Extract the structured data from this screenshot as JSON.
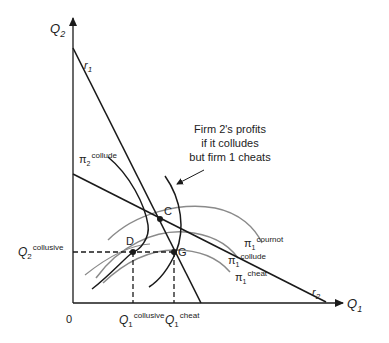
{
  "axes": {
    "y_label_main": "Q",
    "y_label_sub": "2",
    "x_label_main": "Q",
    "x_label_sub": "1",
    "origin": "0"
  },
  "lines": {
    "r1_main": "r",
    "r1_sub": "1",
    "r2_main": "r",
    "r2_sub": "2"
  },
  "points": {
    "C": "C",
    "D": "D",
    "G": "G"
  },
  "curve_labels": {
    "pi2_collude": {
      "symbol": "π",
      "sub": "2",
      "sup": "collude"
    },
    "pi1_cournot": {
      "symbol": "π",
      "sub": "1",
      "sup": "cournot"
    },
    "pi1_collude": {
      "symbol": "π",
      "sub": "1",
      "sup": "collude"
    },
    "pi1_cheat": {
      "symbol": "π",
      "sub": "1",
      "sup": "cheat"
    }
  },
  "tick_labels": {
    "q2_collusive": {
      "main": "Q",
      "sub": "2",
      "sup": "collusive"
    },
    "q1_collusive": {
      "main": "Q",
      "sub": "1",
      "sup": "collusive"
    },
    "q1_cheat": {
      "main": "Q",
      "sub": "1",
      "sup": "cheat"
    }
  },
  "annotation": {
    "line1": "Firm 2's profits",
    "line2": "if it colludes",
    "line3": "but firm 1 cheats"
  },
  "colors": {
    "line": "#1a1a1a",
    "isoprofit_firm1": "#8a8a8a"
  }
}
